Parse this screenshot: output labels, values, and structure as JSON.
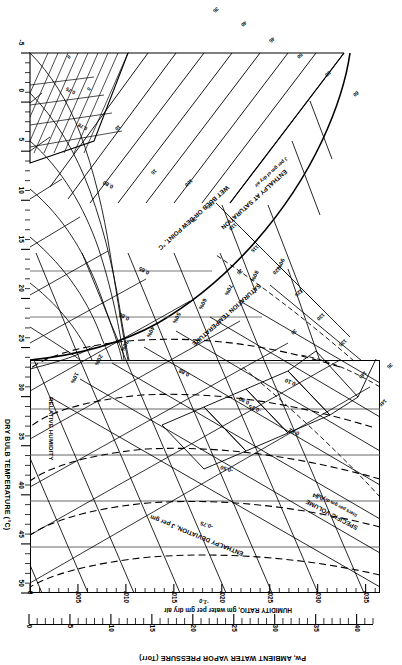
{
  "chart_data": {
    "type": "line",
    "orientation": "rotated-180",
    "axes": {
      "vapor_pressure": {
        "label": "Pw, AMBIENT WATER VAPOR PRESSURE (Torr)",
        "ticks": [
          0,
          5,
          10,
          15,
          20,
          25,
          30,
          35,
          40
        ],
        "tick_labels": [
          "0",
          "5",
          "10",
          "15",
          "20",
          "25",
          "30",
          "35",
          "40"
        ],
        "range": [
          0,
          42
        ],
        "minor_step": 1
      },
      "humidity_ratio": {
        "label": "HUMIDITY RATIO, gm water per gm dry air",
        "ticks": [
          0,
          0.005,
          0.01,
          0.015,
          0.02,
          0.025,
          0.03,
          0.035
        ],
        "tick_labels": [
          "0",
          ".005",
          ".010",
          ".015",
          ".020",
          ".025",
          ".030",
          ".035"
        ],
        "range": [
          0,
          0.0365
        ]
      },
      "dry_bulb": {
        "label": "DRY BULB TEMPERATURE (°C)",
        "ticks": [
          -5,
          0,
          5,
          10,
          15,
          20,
          25,
          30,
          35,
          40,
          45,
          50
        ],
        "tick_labels": [
          "-5",
          "0",
          "5",
          "10",
          "15",
          "20",
          "25",
          "30",
          "35",
          "40",
          "45",
          "50"
        ],
        "range": [
          -5,
          50
        ],
        "minor_step": 1
      }
    },
    "families": [
      {
        "name": "relative_humidity",
        "label": "RELATIVE HUMIDITY",
        "unit": "%",
        "style": "solid",
        "values": [
          10,
          20,
          30,
          40,
          50,
          60,
          70,
          80,
          90
        ],
        "value_labels": [
          "10%",
          "20%",
          "30%",
          "40%",
          "50%",
          "60%",
          "70%",
          "80%",
          "90%"
        ]
      },
      {
        "name": "specific_volume",
        "label": "SPECIFIC VOLUME",
        "sublabel": "liters per gm dry air",
        "style": "solid",
        "values": [
          0.75,
          0.8,
          0.85,
          0.9,
          0.92,
          0.94
        ],
        "value_labels": [
          "0.75",
          "0.80",
          "0.85",
          "0.90",
          "0.92",
          "0.94"
        ]
      },
      {
        "name": "enthalpy_deviation",
        "label": "ENTHALPY DEVIATION, J per gm",
        "style": "dashed",
        "values": [
          -0.25,
          -0.5,
          -0.75,
          -1.0
        ],
        "value_labels": [
          "-0.25",
          "-0.50",
          "-0.75",
          "-1.0"
        ]
      },
      {
        "name": "enthalpy_at_saturation",
        "label": "ENTHALPY AT SATURATION",
        "sublabel": "J per gm of dry air",
        "style": "solid",
        "values": [
          20,
          25,
          30,
          35,
          40,
          45,
          50,
          55,
          60,
          100,
          105,
          110,
          115,
          120,
          125,
          130,
          135,
          140,
          145
        ],
        "value_labels": [
          "20",
          "25",
          "30",
          "35",
          "40",
          "45",
          "50",
          "55",
          "60",
          "100",
          "105",
          "110",
          "115",
          "120",
          "125",
          "130",
          "135",
          "140",
          "145"
        ]
      },
      {
        "name": "wet_bulb",
        "label": "WET BULB OR DEW POINT, °C",
        "style": "solid",
        "values": [
          0,
          5,
          10,
          15,
          20,
          25,
          30,
          35
        ],
        "value_labels": [
          "0",
          "5",
          "10",
          "15",
          "20",
          "25",
          "30",
          "35"
        ]
      }
    ],
    "colors": {
      "line": "#000000",
      "background": "#ffffff",
      "grid": "#555555"
    }
  },
  "pw_axis": {
    "title": "Pw, AMBIENT WATER VAPOR PRESSURE (Torr)",
    "labels": [
      "0",
      "5",
      "10",
      "15",
      "20",
      "25",
      "30",
      "35",
      "40"
    ]
  },
  "hr_axis": {
    "title": "HUMIDITY RATIO, gm water per gm dry air",
    "labels": [
      "0",
      ".005",
      ".010",
      ".015",
      ".020",
      ".025",
      ".030",
      ".035"
    ]
  },
  "db_axis": {
    "title": "DRY BULB TEMPERATURE (°C)",
    "labels": [
      "-5",
      "0",
      "5",
      "10",
      "15",
      "20",
      "25",
      "30",
      "35",
      "40",
      "45",
      "50"
    ]
  },
  "captions": {
    "specific_volume_1": "SPECIFIC VOLUME",
    "specific_volume_2": "liters per gm dry air",
    "enthalpy_deviation": "ENTHALPY DEVIATION, J per gm",
    "enthalpy_saturation_1": "ENTHALPY AT SATURATION",
    "enthalpy_saturation_2": "J per gm of dry air",
    "wet_bulb": "WET BULB OR DEW POINT, °C",
    "saturation_temperature": "SATURATION TEMPERATURE",
    "relative_humidity": "RELATIVE HUMIDITY"
  },
  "inline_labels": {
    "sv_094": "0.94",
    "sv_092": "0.92",
    "sv_090": "0.90",
    "sv_088": "0.88",
    "sv_086": "0.86",
    "sv_085": "0.85",
    "sv_084": "0.84",
    "sv_080": "0.80",
    "sv_078": "0.78",
    "sv_076": "0.76",
    "sv_075": "0.75",
    "ed_025": "-0.25",
    "ed_050": "-0.50",
    "ed_075": "-0.75",
    "ed_100": "-1.0",
    "ed_010": "-0.10",
    "rh_10": "10%",
    "rh_20": "20%",
    "rh_30": "30%",
    "rh_40": "40%",
    "rh_50": "50%",
    "rh_60": "60%",
    "rh_70": "70%",
    "rh_80": "80%",
    "rh_90": "90%",
    "h_145": "145",
    "h_140": "140",
    "h_135": "135",
    "h_130": "130",
    "h_125": "125",
    "h_120": "120",
    "h_115": "115",
    "h_110": "110",
    "h_105": "105",
    "h_100": "100",
    "h_60": "60",
    "h_55": "55",
    "h_50": "50",
    "h_45": "45",
    "h_40": "40",
    "h_35": "35",
    "h_30": "30",
    "h_25": "25",
    "h_20": "20",
    "wb_35": "35",
    "wb_30": "30",
    "wb_25": "25",
    "wb_20": "20",
    "wb_15": "15",
    "wb_10": "10",
    "wb_5": "5",
    "wb_0": "0"
  }
}
